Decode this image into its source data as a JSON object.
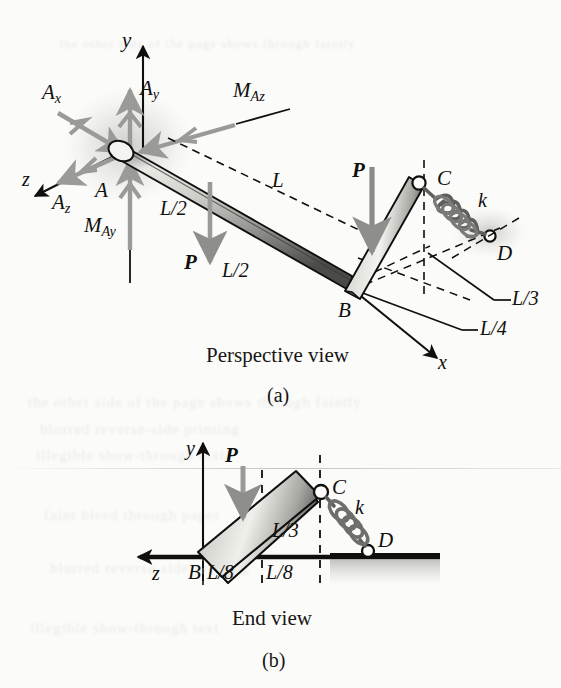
{
  "figure": {
    "type": "engineering-free-body-diagram",
    "panels": [
      {
        "id": "a",
        "caption": "Perspective view",
        "subcaption": "(a)",
        "axes": [
          {
            "name": "y",
            "label": "y",
            "direction": "up"
          },
          {
            "name": "z",
            "label": "z",
            "direction": "down-left"
          },
          {
            "name": "x",
            "label": "x",
            "direction": "down-right"
          }
        ],
        "points": [
          {
            "label": "A",
            "role": "fixed-support-origin"
          },
          {
            "label": "B",
            "role": "bend-corner"
          },
          {
            "label": "C",
            "role": "spring-attachment-top"
          },
          {
            "label": "D",
            "role": "spring-anchor"
          }
        ],
        "reactions": [
          {
            "label": "Ax",
            "base": "A",
            "sub": "x"
          },
          {
            "label": "Ay",
            "base": "A",
            "sub": "y"
          },
          {
            "label": "Az",
            "base": "A",
            "sub": "z"
          },
          {
            "label": "MAz",
            "base": "M",
            "sub": "Az"
          },
          {
            "label": "MAy",
            "base": "M",
            "sub": "Ay"
          }
        ],
        "loads": [
          {
            "label": "P",
            "style": "bold-italic",
            "location": "mid-span-AB"
          },
          {
            "label": "P",
            "style": "bold-italic",
            "location": "segment-BC"
          }
        ],
        "dimensions": [
          {
            "label": "L",
            "note": "overall projected length A to B region"
          },
          {
            "label": "L/2",
            "note": "first half of bar AB"
          },
          {
            "label": "L/2",
            "note": "second half of bar AB"
          },
          {
            "label": "L/3",
            "note": "distance to D"
          },
          {
            "label": "L/4",
            "note": "offset along x"
          }
        ],
        "spring": {
          "label": "k",
          "from": "C",
          "to": "D"
        }
      },
      {
        "id": "b",
        "caption": "End view",
        "subcaption": "(b)",
        "axes": [
          {
            "name": "y",
            "label": "y",
            "direction": "up"
          },
          {
            "name": "z",
            "label": "z",
            "direction": "left"
          }
        ],
        "points": [
          {
            "label": "B",
            "role": "bar-base"
          },
          {
            "label": "C",
            "role": "spring-attachment-top"
          },
          {
            "label": "D",
            "role": "spring-anchor-on-ground"
          }
        ],
        "loads": [
          {
            "label": "P",
            "style": "bold-italic",
            "location": "on-bar-BC"
          }
        ],
        "dimensions": [
          {
            "label": "L/3",
            "note": "vertical height of C above ground"
          },
          {
            "label": "L/8",
            "note": "first horizontal division"
          },
          {
            "label": "L/8",
            "note": "second horizontal division"
          }
        ],
        "spring": {
          "label": "k",
          "from": "C",
          "to": "D"
        }
      }
    ],
    "colors": {
      "ink": "#100f0d",
      "paper": "#fbfbf9",
      "reaction_arrow": "#9a9a98",
      "load_arrow": "#8e8e8c",
      "bar_light": "#efefec",
      "bar_mid": "#b9b9b5",
      "bar_dark": "#4a4a47",
      "shadow": "#c9c9c5",
      "spring": "#6e6e6b"
    }
  },
  "ghost_text": {
    "line1": "the other side of the page shows through faintly",
    "line2": "blurred reverse-side printing",
    "line3": "illegible show-through text",
    "line4": "faint bleed through paper"
  }
}
